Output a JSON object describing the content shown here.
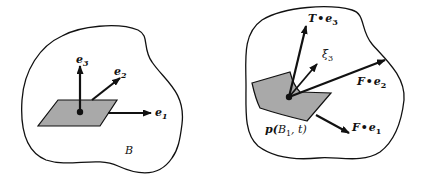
{
  "figure_left": {
    "title": "reference configuration",
    "body_label": "B",
    "vectors": [
      {
        "name": "e1",
        "label": "e",
        "sub": "1"
      },
      {
        "name": "e2",
        "label": "e",
        "sub": "2"
      },
      {
        "name": "e3",
        "label": "e",
        "sub": "3"
      }
    ],
    "patch": "flat parallelogram surface element"
  },
  "figure_right": {
    "title": "deformed configuration",
    "region_label": {
      "main": "p(",
      "script": "B",
      "sub": "1",
      "tail": ", t)"
    },
    "vectors": [
      {
        "name": "T-e3",
        "pre": "T",
        "dot": "•",
        "label": "e",
        "sub": "3"
      },
      {
        "name": "xi3",
        "label": "ξ",
        "sub": "3"
      },
      {
        "name": "F-e2",
        "pre": "F",
        "dot": "•",
        "label": "e",
        "sub": "2"
      },
      {
        "name": "F-e1",
        "pre": "F",
        "dot": "•",
        "label": "e",
        "sub": "1"
      }
    ],
    "patch": "curved surface element"
  },
  "colors": {
    "stroke": "#111111",
    "patch_fill": "#a9a9a9",
    "background": "#ffffff"
  }
}
